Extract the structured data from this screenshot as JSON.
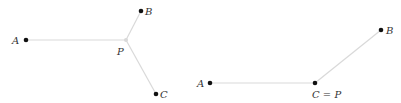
{
  "figure": {
    "left_panel": {
      "description": "Fermat point configuration: P joins A, B, C",
      "labels": {
        "A": "A",
        "B": "B",
        "C": "C",
        "P": "P"
      }
    },
    "right_panel": {
      "description": "Degenerate case: Fermat point coincides with C",
      "labels": {
        "A": "A",
        "B": "B",
        "CP": "C = P"
      }
    },
    "colors": {
      "edge": "#d9d9d9",
      "point": "#111111",
      "label": "#333333"
    }
  }
}
